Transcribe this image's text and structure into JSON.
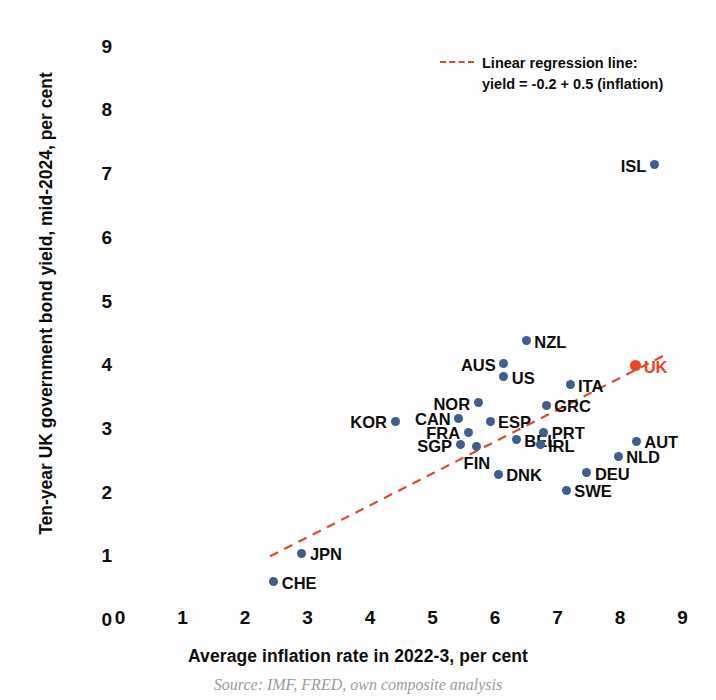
{
  "chart_data": {
    "type": "scatter",
    "title": "",
    "xlabel": "Average inflation rate in 2022-3, per cent",
    "ylabel": "Ten-year UK government bond yield, mid-2024, per cent",
    "xlim": [
      0,
      9
    ],
    "ylim": [
      0,
      9
    ],
    "xticks": [
      "0",
      "1",
      "2",
      "3",
      "4",
      "5",
      "6",
      "7",
      "8",
      "9"
    ],
    "yticks": [
      "0",
      "1",
      "2",
      "3",
      "4",
      "5",
      "6",
      "7",
      "8",
      "9"
    ],
    "grid": false,
    "legend_position": "top-right",
    "point_color": "#3e5e8e",
    "highlight_color": "#e8442a",
    "legend": {
      "label": "Linear regression line:\nyield = -0.2 + 0.5 (inflation)",
      "line_style": "dashed",
      "color": "#e8442a"
    },
    "regression": {
      "intercept": -0.2,
      "slope": 0.5,
      "x_start": 2.4,
      "x_end": 8.72,
      "y_start": 1.0,
      "y_end": 4.16
    },
    "points": [
      {
        "label": "ISL",
        "x": 8.55,
        "y": 7.15,
        "label_pos": "left",
        "highlight": false
      },
      {
        "label": "UK",
        "x": 8.25,
        "y": 3.99,
        "label_pos": "right",
        "highlight": true
      },
      {
        "label": "NZL",
        "x": 6.5,
        "y": 4.38,
        "label_pos": "right",
        "highlight": false
      },
      {
        "label": "AUS",
        "x": 6.14,
        "y": 4.02,
        "label_pos": "left",
        "highlight": false
      },
      {
        "label": "US",
        "x": 6.14,
        "y": 3.82,
        "label_pos": "right",
        "highlight": false
      },
      {
        "label": "ITA",
        "x": 7.2,
        "y": 3.69,
        "label_pos": "right",
        "highlight": false
      },
      {
        "label": "GRC",
        "x": 6.82,
        "y": 3.37,
        "label_pos": "right",
        "highlight": false
      },
      {
        "label": "NOR",
        "x": 5.73,
        "y": 3.41,
        "label_pos": "left",
        "highlight": false
      },
      {
        "label": "ESP",
        "x": 5.92,
        "y": 3.12,
        "label_pos": "right",
        "highlight": false
      },
      {
        "label": "CAN",
        "x": 5.42,
        "y": 3.17,
        "label_pos": "left",
        "highlight": false
      },
      {
        "label": "FRA",
        "x": 5.57,
        "y": 2.95,
        "label_pos": "left",
        "highlight": false
      },
      {
        "label": "KOR",
        "x": 4.4,
        "y": 3.12,
        "label_pos": "left",
        "highlight": false
      },
      {
        "label": "SGP",
        "x": 5.44,
        "y": 2.75,
        "label_pos": "left",
        "highlight": false
      },
      {
        "label": "FIN",
        "x": 5.71,
        "y": 2.72,
        "label_pos": "below",
        "highlight": false
      },
      {
        "label": "BEL",
        "x": 6.34,
        "y": 2.83,
        "label_pos": "right",
        "highlight": false
      },
      {
        "label": "IRL",
        "x": 6.72,
        "y": 2.75,
        "label_pos": "right",
        "highlight": false
      },
      {
        "label": "PRT",
        "x": 6.78,
        "y": 2.95,
        "label_pos": "right",
        "highlight": false
      },
      {
        "label": "AUT",
        "x": 8.26,
        "y": 2.81,
        "label_pos": "right",
        "highlight": false
      },
      {
        "label": "NLD",
        "x": 7.97,
        "y": 2.57,
        "label_pos": "right",
        "highlight": false
      },
      {
        "label": "DEU",
        "x": 7.47,
        "y": 2.31,
        "label_pos": "right",
        "highlight": false
      },
      {
        "label": "DNK",
        "x": 6.05,
        "y": 2.29,
        "label_pos": "right",
        "highlight": false
      },
      {
        "label": "SWE",
        "x": 7.14,
        "y": 2.04,
        "label_pos": "right",
        "highlight": false
      },
      {
        "label": "JPN",
        "x": 2.91,
        "y": 1.05,
        "label_pos": "right",
        "highlight": false
      },
      {
        "label": "CHE",
        "x": 2.46,
        "y": 0.6,
        "label_pos": "right",
        "highlight": false
      }
    ]
  },
  "footer": {
    "source_caption": "Source: IMF, FRED, own composite analysis"
  }
}
